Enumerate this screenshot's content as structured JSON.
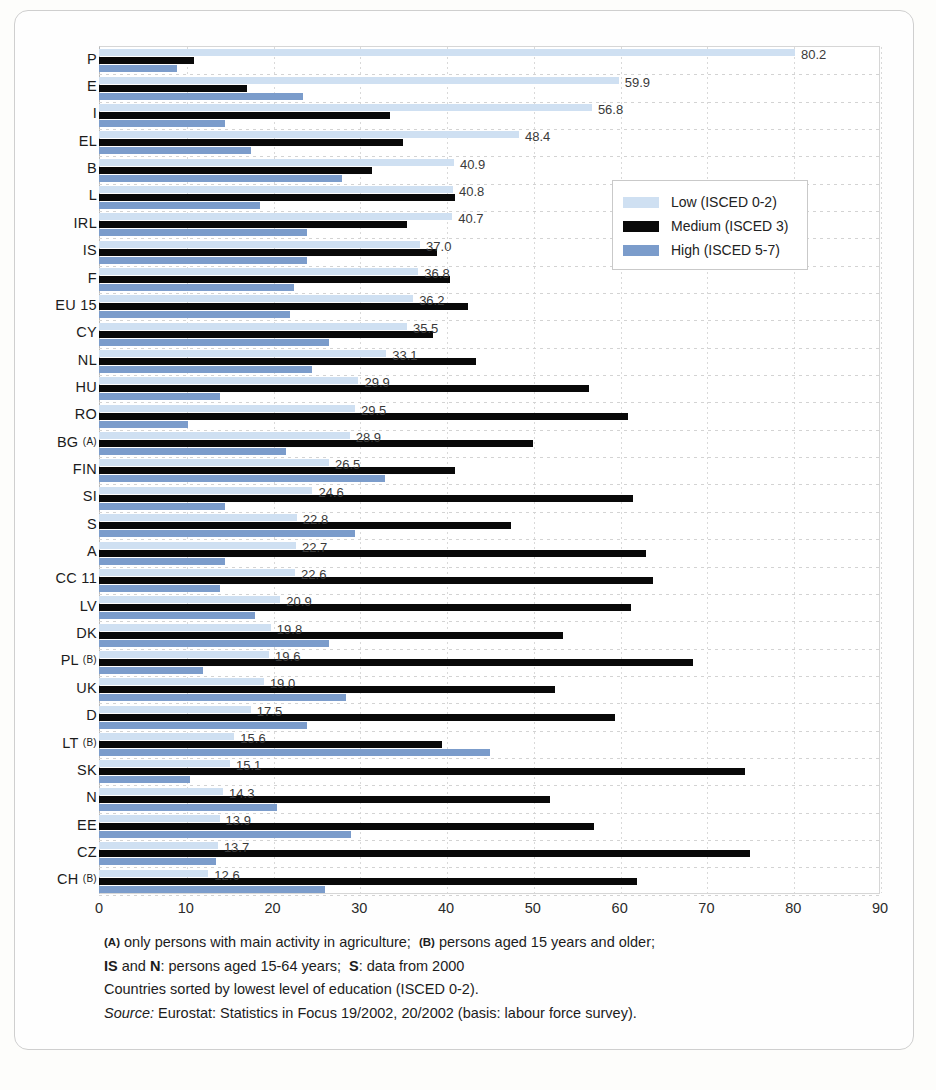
{
  "chart_data": {
    "type": "bar",
    "orientation": "horizontal",
    "title": "",
    "xlabel": "",
    "ylabel": "",
    "xlim": [
      0,
      90
    ],
    "xticks": [
      0,
      10,
      20,
      30,
      40,
      50,
      60,
      70,
      80,
      90
    ],
    "grid": true,
    "legend_position": "upper-right",
    "series": [
      {
        "name": "Low (ISCED 0-2)",
        "color": "#cfe0f2",
        "values": [
          80.2,
          59.9,
          56.8,
          48.4,
          40.9,
          40.8,
          40.7,
          37.0,
          36.8,
          36.2,
          35.5,
          33.1,
          29.9,
          29.5,
          28.9,
          26.5,
          24.6,
          22.8,
          22.7,
          22.6,
          20.9,
          19.8,
          19.6,
          19.0,
          17.5,
          15.6,
          15.1,
          14.3,
          13.9,
          13.7,
          12.6
        ]
      },
      {
        "name": "Medium (ISCED 3)",
        "color": "#090909",
        "values": [
          11.0,
          17.0,
          33.5,
          35.0,
          31.5,
          41.0,
          35.5,
          39.0,
          40.5,
          42.5,
          38.5,
          43.5,
          56.5,
          61.0,
          50.0,
          41.0,
          61.5,
          47.5,
          63.0,
          63.8,
          61.3,
          53.5,
          68.5,
          52.5,
          59.5,
          39.5,
          74.5,
          52.0,
          57.0,
          75.0,
          62.0
        ]
      },
      {
        "name": "High (ISCED 5-7)",
        "color": "#7b9ccb",
        "values": [
          9.0,
          23.5,
          14.5,
          17.5,
          28.0,
          18.5,
          24.0,
          24.0,
          22.5,
          22.0,
          26.5,
          24.5,
          14.0,
          10.3,
          21.5,
          33.0,
          14.5,
          29.5,
          14.5,
          14.0,
          18.0,
          26.5,
          12.0,
          28.5,
          24.0,
          45.0,
          10.5,
          20.5,
          29.0,
          13.5,
          26.0
        ]
      }
    ],
    "categories": [
      {
        "label": "P",
        "note": ""
      },
      {
        "label": "E",
        "note": ""
      },
      {
        "label": "I",
        "note": ""
      },
      {
        "label": "EL",
        "note": ""
      },
      {
        "label": "B",
        "note": ""
      },
      {
        "label": "L",
        "note": ""
      },
      {
        "label": "IRL",
        "note": ""
      },
      {
        "label": "IS",
        "note": ""
      },
      {
        "label": "F",
        "note": ""
      },
      {
        "label": "EU 15",
        "note": ""
      },
      {
        "label": "CY",
        "note": ""
      },
      {
        "label": "NL",
        "note": ""
      },
      {
        "label": "HU",
        "note": ""
      },
      {
        "label": "RO",
        "note": ""
      },
      {
        "label": "BG",
        "note": "(A)"
      },
      {
        "label": "FIN",
        "note": ""
      },
      {
        "label": "SI",
        "note": ""
      },
      {
        "label": "S",
        "note": ""
      },
      {
        "label": "A",
        "note": ""
      },
      {
        "label": "CC 11",
        "note": ""
      },
      {
        "label": "LV",
        "note": ""
      },
      {
        "label": "DK",
        "note": ""
      },
      {
        "label": "PL",
        "note": "(B)"
      },
      {
        "label": "UK",
        "note": ""
      },
      {
        "label": "D",
        "note": ""
      },
      {
        "label": "LT",
        "note": "(B)"
      },
      {
        "label": "SK",
        "note": ""
      },
      {
        "label": "N",
        "note": ""
      },
      {
        "label": "EE",
        "note": ""
      },
      {
        "label": "CZ",
        "note": ""
      },
      {
        "label": "CH",
        "note": "(B)"
      }
    ],
    "value_labels": [
      "80.2",
      "59.9",
      "56.8",
      "48.4",
      "40.9",
      "40.8",
      "40.7",
      "37.0",
      "36.8",
      "36.2",
      "35.5",
      "33.1",
      "29.9",
      "29.5",
      "28.9",
      "26.5",
      "24.6",
      "22.8",
      "22.7",
      "22.6",
      "20.9",
      "19.8",
      "19.6",
      "19.0",
      "17.5",
      "15.6",
      "15.1",
      "14.3",
      "13.9",
      "13.7",
      "12.6"
    ]
  },
  "legend": {
    "items": [
      {
        "label": "Low (ISCED 0-2)",
        "color": "#cfe0f2"
      },
      {
        "label": "Medium (ISCED 3)",
        "color": "#090909"
      },
      {
        "label": "High (ISCED 5-7)",
        "color": "#7b9ccb"
      }
    ]
  },
  "notes": {
    "line1_a_marker": "(A)",
    "line1_a_text": "only persons with main activity in agriculture;",
    "line1_b_marker": "(B)",
    "line1_b_text": "persons aged 15 years and older;",
    "line2_is": "IS",
    "line2_and": "and",
    "line2_n": "N",
    "line2_text": ": persons aged 15-64 years;",
    "line2_s": "S",
    "line2_tail": ": data from 2000",
    "line3": "Countries sorted by lowest level of education (ISCED 0-2).",
    "line4_label": "Source:",
    "line4_text": "Eurostat: Statistics in Focus 19/2002, 20/2002 (basis: labour force survey)."
  }
}
